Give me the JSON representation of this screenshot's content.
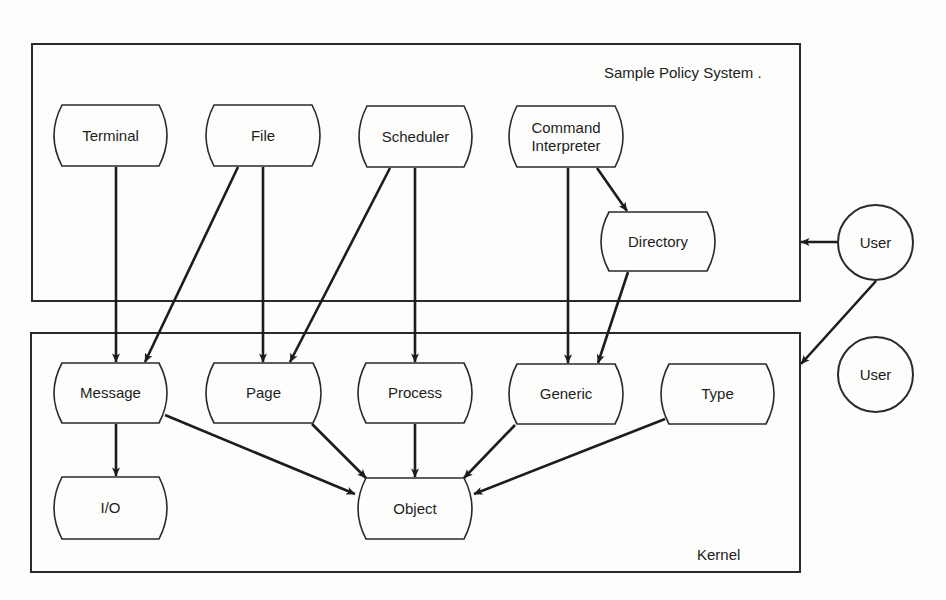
{
  "diagram": {
    "regions": {
      "policy": {
        "label": "Sample Policy System .",
        "box": {
          "x": 31,
          "y": 43,
          "w": 770,
          "h": 259
        }
      },
      "kernel": {
        "label": "Kernel",
        "box": {
          "x": 30,
          "y": 332,
          "w": 771,
          "h": 241
        }
      }
    },
    "nodes": {
      "terminal": {
        "label": "Terminal",
        "x": 50,
        "y": 104,
        "w": 121,
        "h": 63
      },
      "file": {
        "label": "File",
        "x": 202,
        "y": 104,
        "w": 122,
        "h": 63
      },
      "scheduler": {
        "label": "Scheduler",
        "x": 355,
        "y": 105,
        "w": 121,
        "h": 63
      },
      "command": {
        "label": "Command\nInterpreter",
        "x": 505,
        "y": 105,
        "w": 122,
        "h": 63
      },
      "directory": {
        "label": "Directory",
        "x": 597,
        "y": 211,
        "w": 122,
        "h": 61
      },
      "message": {
        "label": "Message",
        "x": 50,
        "y": 362,
        "w": 121,
        "h": 62
      },
      "page": {
        "label": "Page",
        "x": 202,
        "y": 362,
        "w": 123,
        "h": 62
      },
      "process": {
        "label": "Process",
        "x": 354,
        "y": 362,
        "w": 122,
        "h": 62
      },
      "generic": {
        "label": "Generic",
        "x": 505,
        "y": 363,
        "w": 122,
        "h": 62
      },
      "type": {
        "label": "Type",
        "x": 657,
        "y": 363,
        "w": 121,
        "h": 62
      },
      "io": {
        "label": "I/O",
        "x": 50,
        "y": 476,
        "w": 121,
        "h": 64
      },
      "object": {
        "label": "Object",
        "x": 354,
        "y": 477,
        "w": 122,
        "h": 63
      }
    },
    "users": [
      {
        "label": "User",
        "cx": 875,
        "cy": 242,
        "r": 38
      },
      {
        "label": "User",
        "cx": 875,
        "cy": 374,
        "r": 38
      }
    ],
    "edges": [
      {
        "from": "Terminal",
        "to": "Message",
        "x1": 116,
        "y1": 167,
        "x2": 116,
        "y2": 362
      },
      {
        "from": "File",
        "to": "Message",
        "x1": 238,
        "y1": 167,
        "x2": 145,
        "y2": 362
      },
      {
        "from": "File",
        "to": "Page",
        "x1": 263,
        "y1": 167,
        "x2": 263,
        "y2": 362
      },
      {
        "from": "Scheduler",
        "to": "Page",
        "x1": 390,
        "y1": 168,
        "x2": 290,
        "y2": 362
      },
      {
        "from": "Scheduler",
        "to": "Process",
        "x1": 415,
        "y1": 168,
        "x2": 415,
        "y2": 362
      },
      {
        "from": "Command Interpreter",
        "to": "Directory",
        "x1": 597,
        "y1": 168,
        "x2": 627,
        "y2": 211
      },
      {
        "from": "Command Interpreter",
        "to": "Generic",
        "x1": 568,
        "y1": 168,
        "x2": 568,
        "y2": 363
      },
      {
        "from": "Directory",
        "to": "Generic",
        "x1": 628,
        "y1": 272,
        "x2": 598,
        "y2": 363
      },
      {
        "from": "Message",
        "to": "I/O",
        "x1": 116,
        "y1": 424,
        "x2": 116,
        "y2": 476
      },
      {
        "from": "Message",
        "to": "Object",
        "x1": 165,
        "y1": 415,
        "x2": 355,
        "y2": 494
      },
      {
        "from": "Page",
        "to": "Object",
        "x1": 312,
        "y1": 424,
        "x2": 366,
        "y2": 478
      },
      {
        "from": "Process",
        "to": "Object",
        "x1": 415,
        "y1": 424,
        "x2": 415,
        "y2": 477
      },
      {
        "from": "Generic",
        "to": "Object",
        "x1": 515,
        "y1": 425,
        "x2": 464,
        "y2": 478
      },
      {
        "from": "Type",
        "to": "Object",
        "x1": 665,
        "y1": 419,
        "x2": 474,
        "y2": 494
      },
      {
        "from": "User",
        "to": "Sample Policy System",
        "x1": 837,
        "y1": 242,
        "x2": 801,
        "y2": 242
      },
      {
        "from": "User",
        "to": "Kernel",
        "x1": 876,
        "y1": 281,
        "x2": 801,
        "y2": 364
      }
    ],
    "colors": {
      "ink": "#1c1c1c",
      "paper": "#fdfdfb"
    }
  }
}
